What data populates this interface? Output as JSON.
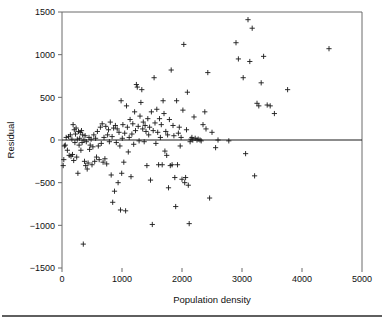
{
  "chart_data": {
    "type": "scatter",
    "title": "",
    "xlabel": "Population density",
    "ylabel": "Residual",
    "xlim": [
      0,
      5000
    ],
    "ylim": [
      -1500,
      1500
    ],
    "xticks": [
      0,
      1000,
      2000,
      3000,
      4000,
      5000
    ],
    "yticks": [
      -1500,
      -1000,
      -500,
      0,
      500,
      1000,
      1500
    ],
    "xtick_labels": [
      "0",
      "1000",
      "2000",
      "3000",
      "4000",
      "5000"
    ],
    "ytick_labels": [
      "-1500",
      "-1000",
      "-500",
      "0",
      "500",
      "1000",
      "1500"
    ],
    "grid": false,
    "legend": null,
    "marker": "plus",
    "reference_line": {
      "axis": "horizontal",
      "value": 0
    },
    "series": [
      {
        "name": "Residuals",
        "color": "#1a1a1a",
        "points": [
          [
            20,
            -300
          ],
          [
            30,
            -230
          ],
          [
            40,
            -70
          ],
          [
            55,
            -60
          ],
          [
            70,
            30
          ],
          [
            90,
            -120
          ],
          [
            110,
            40
          ],
          [
            120,
            -180
          ],
          [
            140,
            60
          ],
          [
            150,
            -190
          ],
          [
            165,
            10
          ],
          [
            175,
            -170
          ],
          [
            185,
            180
          ],
          [
            195,
            -240
          ],
          [
            205,
            120
          ],
          [
            215,
            -30
          ],
          [
            225,
            70
          ],
          [
            235,
            140
          ],
          [
            245,
            -200
          ],
          [
            255,
            10
          ],
          [
            265,
            -390
          ],
          [
            275,
            100
          ],
          [
            285,
            -60
          ],
          [
            295,
            20
          ],
          [
            305,
            90
          ],
          [
            315,
            -120
          ],
          [
            325,
            110
          ],
          [
            335,
            -30
          ],
          [
            345,
            60
          ],
          [
            355,
            -1220
          ],
          [
            365,
            0
          ],
          [
            375,
            -250
          ],
          [
            385,
            50
          ],
          [
            395,
            -300
          ],
          [
            405,
            -20
          ],
          [
            420,
            -340
          ],
          [
            435,
            -270
          ],
          [
            450,
            30
          ],
          [
            460,
            -110
          ],
          [
            470,
            -60
          ],
          [
            485,
            10
          ],
          [
            500,
            -290
          ],
          [
            515,
            -80
          ],
          [
            530,
            60
          ],
          [
            545,
            -250
          ],
          [
            560,
            20
          ],
          [
            575,
            -200
          ],
          [
            590,
            100
          ],
          [
            605,
            -70
          ],
          [
            620,
            -230
          ],
          [
            640,
            150
          ],
          [
            655,
            -40
          ],
          [
            670,
            190
          ],
          [
            685,
            -260
          ],
          [
            700,
            30
          ],
          [
            715,
            -220
          ],
          [
            730,
            160
          ],
          [
            745,
            -280
          ],
          [
            760,
            60
          ],
          [
            775,
            120
          ],
          [
            790,
            -20
          ],
          [
            805,
            210
          ],
          [
            820,
            -410
          ],
          [
            835,
            40
          ],
          [
            845,
            -730
          ],
          [
            860,
            140
          ],
          [
            875,
            -600
          ],
          [
            890,
            170
          ],
          [
            905,
            -30
          ],
          [
            920,
            130
          ],
          [
            935,
            -500
          ],
          [
            950,
            90
          ],
          [
            965,
            -70
          ],
          [
            975,
            -820
          ],
          [
            985,
            460
          ],
          [
            995,
            -390
          ],
          [
            1005,
            20
          ],
          [
            1015,
            180
          ],
          [
            1030,
            -260
          ],
          [
            1045,
            80
          ],
          [
            1060,
            -830
          ],
          [
            1075,
            400
          ],
          [
            1090,
            150
          ],
          [
            1105,
            -140
          ],
          [
            1120,
            30
          ],
          [
            1135,
            240
          ],
          [
            1150,
            -430
          ],
          [
            1165,
            70
          ],
          [
            1180,
            190
          ],
          [
            1195,
            -50
          ],
          [
            1210,
            330
          ],
          [
            1225,
            110
          ],
          [
            1240,
            650
          ],
          [
            1255,
            620
          ],
          [
            1270,
            160
          ],
          [
            1285,
            -10
          ],
          [
            1300,
            280
          ],
          [
            1315,
            440
          ],
          [
            1330,
            590
          ],
          [
            1345,
            130
          ],
          [
            1355,
            210
          ],
          [
            1370,
            -20
          ],
          [
            1385,
            170
          ],
          [
            1400,
            100
          ],
          [
            1415,
            -300
          ],
          [
            1430,
            250
          ],
          [
            1445,
            60
          ],
          [
            1460,
            150
          ],
          [
            1475,
            -470
          ],
          [
            1490,
            330
          ],
          [
            1505,
            -990
          ],
          [
            1520,
            110
          ],
          [
            1535,
            730
          ],
          [
            1550,
            200
          ],
          [
            1565,
            -40
          ],
          [
            1580,
            360
          ],
          [
            1595,
            90
          ],
          [
            1610,
            -290
          ],
          [
            1625,
            250
          ],
          [
            1640,
            30
          ],
          [
            1655,
            180
          ],
          [
            1670,
            -290
          ],
          [
            1685,
            460
          ],
          [
            1700,
            310
          ],
          [
            1715,
            -130
          ],
          [
            1730,
            100
          ],
          [
            1745,
            -180
          ],
          [
            1760,
            60
          ],
          [
            1775,
            -560
          ],
          [
            1790,
            240
          ],
          [
            1805,
            -300
          ],
          [
            1820,
            820
          ],
          [
            1835,
            -290
          ],
          [
            1850,
            170
          ],
          [
            1865,
            50
          ],
          [
            1880,
            -440
          ],
          [
            1895,
            -780
          ],
          [
            1910,
            460
          ],
          [
            1925,
            -290
          ],
          [
            1940,
            80
          ],
          [
            1955,
            150
          ],
          [
            1970,
            -70
          ],
          [
            1985,
            30
          ],
          [
            2000,
            -460
          ],
          [
            2015,
            350
          ],
          [
            2030,
            1120
          ],
          [
            2045,
            -500
          ],
          [
            2060,
            -440
          ],
          [
            2075,
            120
          ],
          [
            2090,
            560
          ],
          [
            2105,
            -530
          ],
          [
            2120,
            -980
          ],
          [
            2135,
            -20
          ],
          [
            2150,
            10
          ],
          [
            2165,
            30
          ],
          [
            2180,
            0
          ],
          [
            2200,
            270
          ],
          [
            2220,
            20
          ],
          [
            2250,
            0
          ],
          [
            2270,
            10
          ],
          [
            2300,
            0
          ],
          [
            2320,
            -10
          ],
          [
            2350,
            180
          ],
          [
            2380,
            330
          ],
          [
            2400,
            130
          ],
          [
            2430,
            790
          ],
          [
            2460,
            -680
          ],
          [
            2500,
            90
          ],
          [
            2560,
            -90
          ],
          [
            2600,
            0
          ],
          [
            2780,
            -10
          ],
          [
            2900,
            1140
          ],
          [
            2940,
            950
          ],
          [
            3020,
            730
          ],
          [
            3060,
            -160
          ],
          [
            3100,
            1410
          ],
          [
            3130,
            920
          ],
          [
            3170,
            1310
          ],
          [
            3210,
            -420
          ],
          [
            3250,
            430
          ],
          [
            3280,
            400
          ],
          [
            3320,
            670
          ],
          [
            3360,
            980
          ],
          [
            3420,
            410
          ],
          [
            3470,
            400
          ],
          [
            3540,
            310
          ],
          [
            3760,
            590
          ],
          [
            4450,
            1070
          ]
        ]
      }
    ]
  },
  "figure": {
    "width": 384,
    "height": 322,
    "plot_left": 62,
    "plot_right": 362,
    "plot_top": 12,
    "plot_bottom": 268
  }
}
